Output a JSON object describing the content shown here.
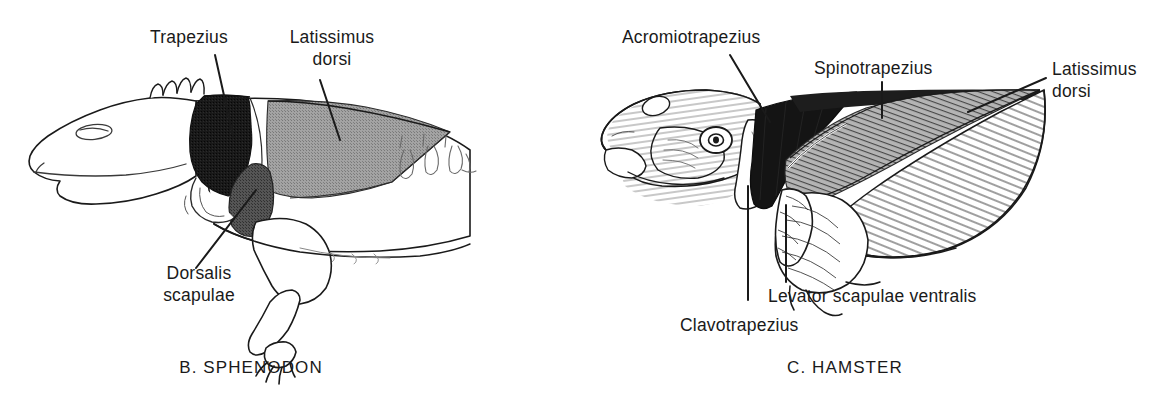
{
  "figure": {
    "background_color": "#ffffff",
    "ink_color": "#1a1a1a",
    "fill_black": "#141414",
    "fill_dark_gray": "#4a4a4a",
    "fill_mid_gray": "#9a9a9a",
    "fill_light": "#ffffff"
  },
  "panels": [
    {
      "id": "sphenodon",
      "caption": "B. SPHENODON",
      "labels": [
        {
          "id": "trapezius",
          "text": "Trapezius"
        },
        {
          "id": "latissimus-dorsi",
          "line1": "Latissimus",
          "line2": "dorsi"
        },
        {
          "id": "dorsalis-scapulae",
          "line1": "Dorsalis",
          "line2": "scapulae"
        }
      ]
    },
    {
      "id": "hamster",
      "caption": "C. HAMSTER",
      "labels": [
        {
          "id": "acromiotrapezius",
          "text": "Acromiotrapezius"
        },
        {
          "id": "spinotrapezius",
          "text": "Spinotrapezius"
        },
        {
          "id": "latissimus-dorsi",
          "line1": "Latissimus",
          "line2": "dorsi"
        },
        {
          "id": "levator-scapulae-ventralis",
          "text": "Levator scapulae ventralis"
        },
        {
          "id": "clavotrapezius",
          "text": "Clavotrapezius"
        }
      ]
    }
  ],
  "text": {
    "sphenodon_trapezius": "Trapezius",
    "sphenodon_latissimus_l1": "Latissimus",
    "sphenodon_latissimus_l2": "dorsi",
    "sphenodon_dorsalis_l1": "Dorsalis",
    "sphenodon_dorsalis_l2": "scapulae",
    "sphenodon_caption": "B. SPHENODON",
    "hamster_acromiotrapezius": "Acromiotrapezius",
    "hamster_spinotrapezius": "Spinotrapezius",
    "hamster_latissimus_l1": "Latissimus",
    "hamster_latissimus_l2": "dorsi",
    "hamster_levator": "Levator scapulae ventralis",
    "hamster_clavotrapezius": "Clavotrapezius",
    "hamster_caption": "C. HAMSTER"
  }
}
